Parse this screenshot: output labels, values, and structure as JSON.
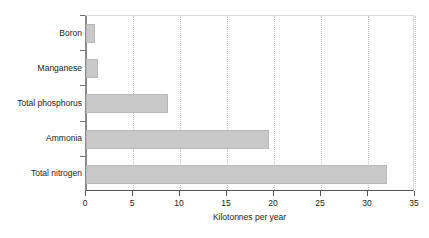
{
  "chart_data": {
    "type": "bar",
    "orientation": "horizontal",
    "title": "",
    "xlabel": "Kilotonnes per year",
    "ylabel": "",
    "categories": [
      "Total nitrogen",
      "Ammonia",
      "Total phosphorus",
      "Manganese",
      "Boron"
    ],
    "values": [
      32.0,
      19.5,
      8.7,
      1.3,
      1.0
    ],
    "series": [
      {
        "name": "Kilotonnes per year",
        "values": [
          32.0,
          19.5,
          8.7,
          1.3,
          1.0
        ]
      }
    ],
    "xlim": [
      0,
      35
    ],
    "xticks": [
      0,
      5,
      10,
      15,
      20,
      25,
      30,
      35
    ],
    "xticklabels": [
      "0",
      "5",
      "10",
      "15",
      "20",
      "25",
      "30",
      "35"
    ],
    "grid": "vertical-dotted",
    "legend": "none",
    "bar_color": "#c9c9c9",
    "axis_color": "#555555",
    "gridline_color": "#c0c0c0",
    "background": "#ffffff"
  }
}
